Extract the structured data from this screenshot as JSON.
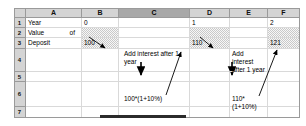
{
  "app": {
    "type": "spreadsheet",
    "title": "Compound interest worksheet"
  },
  "grid": {
    "column_headers": [
      "A",
      "B",
      "C",
      "D",
      "E",
      "F"
    ],
    "selected_column": "C",
    "row_headers": [
      "1",
      "2",
      "3",
      "4",
      "5",
      "6",
      "7"
    ]
  },
  "cells": {
    "a1": "Year",
    "b1": "0",
    "c1": "",
    "d1": "1",
    "e1": "",
    "f1": "2",
    "a2": "Value  of",
    "a3": "Deposit",
    "b3": "100",
    "d3": "110",
    "f3": "121",
    "c4": "Add interest after 1 year",
    "e4": "Add      interest after 1 year",
    "c6": "100*(1+10%)",
    "e6": "110*(1+10%)"
  },
  "annotations": {
    "arrow_b3_to_c4": "arrow from 100 to Add interest after 1 year",
    "arrow_c4_to_c6": "arrow from Add interest after 1 year to 100*(1+10%)",
    "arrow_c6_to_d3": "arrow from 100*(1+10%) to 110",
    "arrow_d3_to_e4": "arrow from 110 to Add interest after 1 year",
    "arrow_e4_to_e6": "arrow from Add interest after 1 year to 110*(1+10%)",
    "arrow_e6_to_f3": "arrow from 110*(1+10%) to 121"
  },
  "colors": {
    "header_fill": "#d4d4d4",
    "header_selected_fill": "#a8a8a8",
    "shaded_cell": "#c9c9c9",
    "gridline": "#d9d9d9",
    "border": "#9a9a9a",
    "arrow": "#000000"
  }
}
